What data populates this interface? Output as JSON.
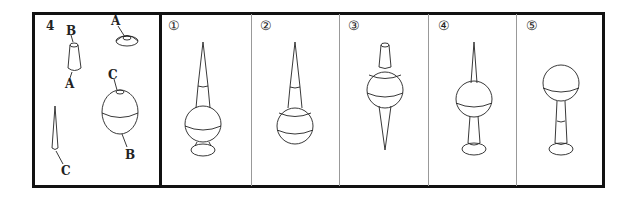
{
  "question": {
    "number": "4",
    "parts_panel": {
      "labels": {
        "cylinder_top": "B",
        "cylinder_bottom": "A",
        "cap_top": "A",
        "sphere_top": "C",
        "sphere_bottom": "B",
        "cone_bottom": "C"
      },
      "parts": [
        "truncated-cone",
        "dome-cap",
        "sphere",
        "spike-cone"
      ]
    },
    "options": [
      {
        "label": "①",
        "description": "spike, truncated cone, sphere, cap base"
      },
      {
        "label": "②",
        "description": "spike, truncated cone, sphere"
      },
      {
        "label": "③",
        "description": "truncated cone top, sphere, spike down"
      },
      {
        "label": "④",
        "description": "spike, sphere, stem, cap base"
      },
      {
        "label": "⑤",
        "description": "sphere, stem, cap base"
      }
    ]
  }
}
